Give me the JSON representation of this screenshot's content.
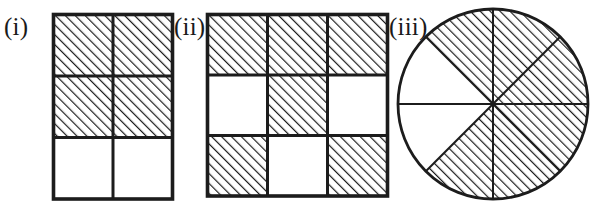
{
  "figure_set": {
    "title": "Fraction shading figures",
    "background_color": "#ffffff",
    "ink_color": "#1c1c1c",
    "hatch": {
      "direction": "forward-slash",
      "angle_degrees": 45,
      "spacing_px": 7,
      "line_width_px": 2.4,
      "color": "#1c1c1c"
    },
    "figures": [
      {
        "id": "i",
        "label": "(i)",
        "shape": "rectangle-grid",
        "columns": 2,
        "rows": 3,
        "total_parts": 6,
        "shaded_parts": 4,
        "fraction": "4/6",
        "cells": [
          {
            "row": 1,
            "col": 1,
            "shaded": true
          },
          {
            "row": 1,
            "col": 2,
            "shaded": true
          },
          {
            "row": 2,
            "col": 1,
            "shaded": true
          },
          {
            "row": 2,
            "col": 2,
            "shaded": true
          },
          {
            "row": 3,
            "col": 1,
            "shaded": false
          },
          {
            "row": 3,
            "col": 2,
            "shaded": false
          }
        ]
      },
      {
        "id": "ii",
        "label": "(ii)",
        "shape": "rectangle-grid",
        "columns": 3,
        "rows": 3,
        "total_parts": 9,
        "shaded_parts": 6,
        "fraction": "6/9",
        "cells": [
          {
            "row": 1,
            "col": 1,
            "shaded": true
          },
          {
            "row": 1,
            "col": 2,
            "shaded": true
          },
          {
            "row": 1,
            "col": 3,
            "shaded": true
          },
          {
            "row": 2,
            "col": 1,
            "shaded": false
          },
          {
            "row": 2,
            "col": 2,
            "shaded": true
          },
          {
            "row": 2,
            "col": 3,
            "shaded": false
          },
          {
            "row": 3,
            "col": 1,
            "shaded": true
          },
          {
            "row": 3,
            "col": 2,
            "shaded": false
          },
          {
            "row": 3,
            "col": 3,
            "shaded": true
          }
        ]
      },
      {
        "id": "iii",
        "label": "(iii)",
        "shape": "circle-sectors",
        "total_parts": 8,
        "shaded_parts": 6,
        "fraction": "6/8",
        "sector_angle_degrees": 45,
        "sectors": [
          {
            "index": 1,
            "start_deg": 0,
            "end_deg": 45,
            "shaded": true
          },
          {
            "index": 2,
            "start_deg": 45,
            "end_deg": 90,
            "shaded": true
          },
          {
            "index": 3,
            "start_deg": 90,
            "end_deg": 135,
            "shaded": true
          },
          {
            "index": 4,
            "start_deg": 135,
            "end_deg": 180,
            "shaded": false
          },
          {
            "index": 5,
            "start_deg": 180,
            "end_deg": 225,
            "shaded": false
          },
          {
            "index": 6,
            "start_deg": 225,
            "end_deg": 270,
            "shaded": true
          },
          {
            "index": 7,
            "start_deg": 270,
            "end_deg": 315,
            "shaded": true
          },
          {
            "index": 8,
            "start_deg": 315,
            "end_deg": 360,
            "shaded": true
          }
        ]
      }
    ]
  }
}
